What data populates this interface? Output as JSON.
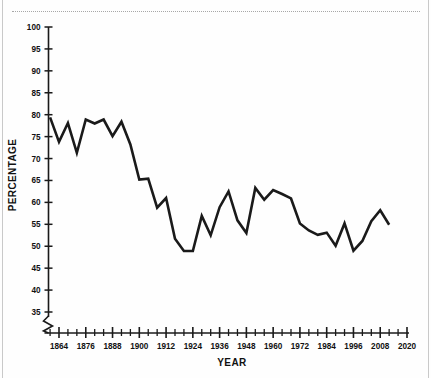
{
  "chart_data": {
    "type": "line",
    "title": "",
    "xlabel": "YEAR",
    "ylabel": "PERCENTAGE",
    "xlim": [
      1856,
      2020
    ],
    "ylim": [
      35,
      100
    ],
    "y_axis_break": true,
    "y_axis_break_note": "axis broken below 35",
    "grid": false,
    "legend": "none",
    "ytick_labels": [
      "35",
      "40",
      "45",
      "50",
      "55",
      "60",
      "65",
      "70",
      "75",
      "80",
      "85",
      "90",
      "95",
      "100"
    ],
    "ytick_values": [
      35,
      40,
      45,
      50,
      55,
      60,
      65,
      70,
      75,
      80,
      85,
      90,
      95,
      100
    ],
    "xtick_labels": [
      "1864",
      "1876",
      "1888",
      "1900",
      "1912",
      "1924",
      "1936",
      "1948",
      "1960",
      "1972",
      "1984",
      "1996",
      "2008",
      "2020"
    ],
    "xtick_values": [
      1864,
      1876,
      1888,
      1900,
      1912,
      1924,
      1936,
      1948,
      1960,
      1972,
      1984,
      1996,
      2008,
      2020
    ],
    "xminor_step": 4,
    "line_color": "#1a1a1a",
    "line_width": 2.6,
    "x": [
      1860,
      1864,
      1868,
      1872,
      1876,
      1880,
      1884,
      1888,
      1892,
      1896,
      1900,
      1904,
      1908,
      1912,
      1916,
      1920,
      1924,
      1928,
      1932,
      1936,
      1940,
      1944,
      1948,
      1952,
      1956,
      1960,
      1964,
      1968,
      1972,
      1976,
      1980,
      1984,
      1988,
      1992,
      1996,
      2000,
      2004,
      2008,
      2012
    ],
    "values": [
      79.4,
      73.8,
      78.1,
      71.3,
      78.9,
      78.0,
      78.9,
      75.1,
      78.4,
      73.2,
      65.2,
      65.4,
      58.8,
      61.0,
      51.7,
      48.9,
      56.9,
      56.9,
      52.5,
      58.9,
      62.5,
      55.9,
      53.0,
      63.3,
      60.6,
      62.8,
      61.9,
      60.9,
      55.2,
      53.6,
      52.6,
      53.1,
      50.1,
      55.2,
      49.0,
      51.2,
      55.7,
      58.2,
      54.9
    ],
    "series": [
      {
        "name": "Percentage",
        "points": [
          {
            "x": 1860,
            "y": 79.4
          },
          {
            "x": 1864,
            "y": 73.8
          },
          {
            "x": 1868,
            "y": 78.1
          },
          {
            "x": 1872,
            "y": 71.3
          },
          {
            "x": 1876,
            "y": 78.9
          },
          {
            "x": 1880,
            "y": 78.0
          },
          {
            "x": 1884,
            "y": 78.9
          },
          {
            "x": 1888,
            "y": 75.1
          },
          {
            "x": 1892,
            "y": 78.4
          },
          {
            "x": 1896,
            "y": 73.2
          },
          {
            "x": 1900,
            "y": 65.2
          },
          {
            "x": 1904,
            "y": 65.4
          },
          {
            "x": 1908,
            "y": 58.8
          },
          {
            "x": 1912,
            "y": 61.0
          },
          {
            "x": 1916,
            "y": 51.7
          },
          {
            "x": 1920,
            "y": 48.9
          },
          {
            "x": 1924,
            "y": 48.9
          },
          {
            "x": 1928,
            "y": 56.9
          },
          {
            "x": 1932,
            "y": 52.5
          },
          {
            "x": 1936,
            "y": 58.9
          },
          {
            "x": 1940,
            "y": 62.5
          },
          {
            "x": 1944,
            "y": 55.9
          },
          {
            "x": 1948,
            "y": 53.0
          },
          {
            "x": 1952,
            "y": 63.3
          },
          {
            "x": 1956,
            "y": 60.6
          },
          {
            "x": 1960,
            "y": 62.8
          },
          {
            "x": 1964,
            "y": 61.9
          },
          {
            "x": 1968,
            "y": 60.9
          },
          {
            "x": 1972,
            "y": 55.2
          },
          {
            "x": 1976,
            "y": 53.6
          },
          {
            "x": 1980,
            "y": 52.6
          },
          {
            "x": 1984,
            "y": 53.1
          },
          {
            "x": 1988,
            "y": 50.1
          },
          {
            "x": 1992,
            "y": 55.2
          },
          {
            "x": 1996,
            "y": 49.0
          },
          {
            "x": 2000,
            "y": 51.2
          },
          {
            "x": 2004,
            "y": 55.7
          },
          {
            "x": 2008,
            "y": 58.2
          },
          {
            "x": 2012,
            "y": 54.9
          }
        ]
      }
    ]
  }
}
